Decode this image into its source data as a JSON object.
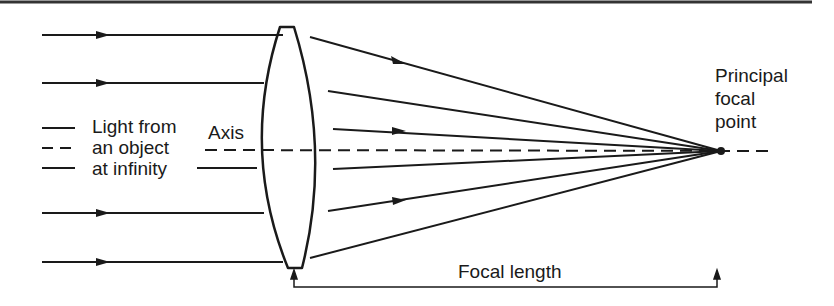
{
  "diagram": {
    "labels": {
      "source_line1": "Light from",
      "source_line2": "an object",
      "source_line3": "at infinity",
      "axis": "Axis",
      "focal_point_line1": "Principal",
      "focal_point_line2": "focal",
      "focal_point_line3": "point",
      "focal_length": "Focal length"
    },
    "colors": {
      "ink": "#1a1a1a",
      "background": "#ffffff",
      "top_rule": "#333333"
    },
    "geometry": {
      "axis_y": 151,
      "lens_center_x": 286,
      "lens_top_y": 27,
      "lens_bottom_y": 268,
      "focal_point": [
        721,
        151
      ],
      "incoming_ray_y": [
        35,
        83,
        213,
        262
      ],
      "legend_lines_y": [
        128,
        148,
        168
      ]
    }
  }
}
